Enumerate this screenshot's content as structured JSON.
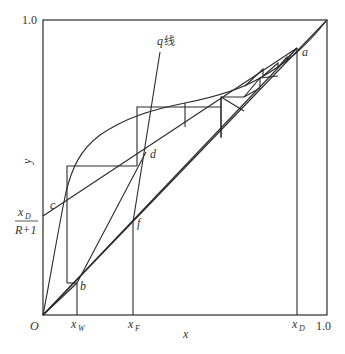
{
  "diagram": {
    "type": "McCabe-Thiele distillation diagram",
    "axes": {
      "x_label": "x",
      "y_label": "y",
      "origin_label": "O",
      "x_max_label": "1.0",
      "y_max_label": "1.0"
    },
    "x_ticks": {
      "xW": {
        "main": "x",
        "sub": "W"
      },
      "xF": {
        "main": "x",
        "sub": "F"
      },
      "xD": {
        "main": "x",
        "sub": "D"
      }
    },
    "intercept_label": {
      "numerator_main": "x",
      "numerator_sub": "D",
      "denominator": "R+1"
    },
    "q_line_label": {
      "q": "q",
      "text": "线"
    },
    "points": {
      "a": "a",
      "b": "b",
      "c": "c",
      "d": "d",
      "f": "f"
    },
    "curves": [
      "equilibrium-curve",
      "diagonal-y-equals-x",
      "rectifying-operating-line",
      "stripping-operating-line",
      "q-line",
      "stage-staircase"
    ]
  }
}
